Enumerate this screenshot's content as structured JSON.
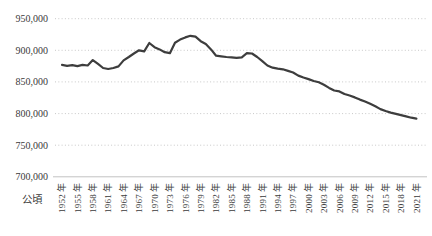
{
  "chart_data": {
    "type": "line",
    "title": "",
    "xlabel": "",
    "ylabel": "",
    "unit_label": "公頃",
    "ylim": [
      700000,
      950000
    ],
    "grid": "horizontal-dotted",
    "legend": "none",
    "colors": {
      "line": "#3d3d3d",
      "grid": "#c8c8c8",
      "axis": "#c2c2c2",
      "text": "#3a3a3a"
    },
    "y_ticks": [
      {
        "label": "950,000",
        "value": 950000
      },
      {
        "label": "900,000",
        "value": 900000
      },
      {
        "label": "850,000",
        "value": 850000
      },
      {
        "label": "800,000",
        "value": 800000
      },
      {
        "label": "750,000",
        "value": 750000
      },
      {
        "label": "700,000",
        "value": 700000
      }
    ],
    "x_tick_years": [
      1952,
      1955,
      1958,
      1961,
      1964,
      1967,
      1970,
      1973,
      1976,
      1979,
      1982,
      1985,
      1988,
      1991,
      1994,
      1997,
      2000,
      2003,
      2006,
      2009,
      2012,
      2015,
      2018,
      2021
    ],
    "x_tick_labels": [
      "1952 年",
      "1955 年",
      "1958 年",
      "1961 年",
      "1964 年",
      "1967 年",
      "1970 年",
      "1973 年",
      "1976 年",
      "1979 年",
      "1982 年",
      "1985 年",
      "1988 年",
      "1991 年",
      "1994 年",
      "1997 年",
      "2000 年",
      "2003 年",
      "2006 年",
      "2009 年",
      "2012 年",
      "2015 年",
      "2018 年",
      "2021 年"
    ],
    "years": [
      1952,
      1953,
      1954,
      1955,
      1956,
      1957,
      1958,
      1959,
      1960,
      1961,
      1962,
      1963,
      1964,
      1965,
      1966,
      1967,
      1968,
      1969,
      1970,
      1971,
      1972,
      1973,
      1974,
      1975,
      1976,
      1977,
      1978,
      1979,
      1980,
      1981,
      1982,
      1983,
      1984,
      1985,
      1986,
      1987,
      1988,
      1989,
      1990,
      1991,
      1992,
      1993,
      1994,
      1995,
      1996,
      1997,
      1998,
      1999,
      2000,
      2001,
      2002,
      2003,
      2004,
      2005,
      2006,
      2007,
      2008,
      2009,
      2010,
      2011,
      2012,
      2013,
      2014,
      2015,
      2016,
      2017,
      2018,
      2019,
      2020,
      2021
    ],
    "values": [
      877000,
      875500,
      876500,
      875000,
      877000,
      876000,
      884500,
      878500,
      872000,
      870500,
      872000,
      874500,
      884000,
      889500,
      895000,
      900000,
      898500,
      911500,
      905000,
      901500,
      897000,
      895500,
      912000,
      917000,
      920500,
      923000,
      921500,
      914500,
      910000,
      901500,
      891500,
      890500,
      889500,
      889000,
      888000,
      889000,
      895500,
      895000,
      889500,
      883000,
      876000,
      872500,
      871000,
      870000,
      867500,
      865000,
      860000,
      857000,
      854500,
      851500,
      849500,
      845500,
      840500,
      836500,
      835000,
      831000,
      828500,
      825500,
      822000,
      819000,
      815500,
      811500,
      807000,
      804000,
      801500,
      799500,
      797500,
      795500,
      793500,
      792000
    ]
  }
}
